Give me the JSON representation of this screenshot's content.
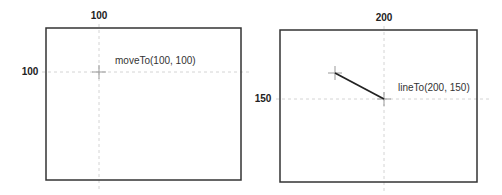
{
  "panels": [
    {
      "id": "moveTo",
      "frame": {
        "x": 46,
        "y": 28,
        "w": 195,
        "h": 152
      },
      "x_tick": {
        "label": "100",
        "x": 99,
        "y": 19
      },
      "y_tick": {
        "label": "100",
        "x": 30,
        "y": 75
      },
      "guide_x": 99,
      "guide_y": 72,
      "point": {
        "x": 99,
        "y": 72
      },
      "annotation": {
        "text": "moveTo(100, 100)",
        "x": 115,
        "y": 64
      }
    },
    {
      "id": "lineTo",
      "frame": {
        "x": 280,
        "y": 30,
        "w": 197,
        "h": 152
      },
      "x_tick": {
        "label": "200",
        "x": 384,
        "y": 21
      },
      "y_tick": {
        "label": "150",
        "x": 263,
        "y": 102
      },
      "guide_x": 384,
      "guide_y": 99,
      "start": {
        "x": 335,
        "y": 73
      },
      "end": {
        "x": 384,
        "y": 99
      },
      "annotation": {
        "text": "lineTo(200, 150)",
        "x": 398,
        "y": 91
      }
    }
  ],
  "colors": {
    "frame": "#333333",
    "guide": "#cccccc",
    "cross": "#999999",
    "line": "#222222"
  }
}
